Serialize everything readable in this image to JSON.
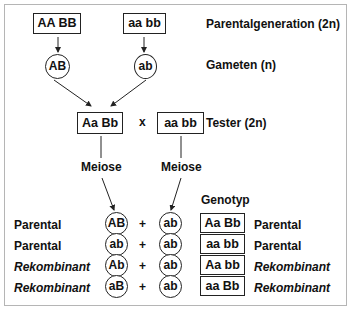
{
  "parental": {
    "left_genotype": "AA BB",
    "right_genotype": "aa bb",
    "label": "Parentalgeneration (2n)"
  },
  "gametes": {
    "left": "AB",
    "right": "ab",
    "label": "Gameten (n)"
  },
  "cross": {
    "f1_genotype": "Aa Bb",
    "operator": "x",
    "tester_genotype": "aa bb",
    "tester_label": "Tester (2n)"
  },
  "meiosis": {
    "left_label": "Meiose",
    "right_label": "Meiose"
  },
  "offspring": {
    "genotype_header": "Genotyp",
    "rows": [
      {
        "type_left": "Parental",
        "gamete_f1": "AB",
        "plus": "+",
        "gamete_tester": "ab",
        "genotype": "Aa Bb",
        "type_right": "Parental",
        "italic": false
      },
      {
        "type_left": "Parental",
        "gamete_f1": "ab",
        "plus": "+",
        "gamete_tester": "ab",
        "genotype": "aa bb",
        "type_right": "Parental",
        "italic": false
      },
      {
        "type_left": "Rekombinant",
        "gamete_f1": "Ab",
        "plus": "+",
        "gamete_tester": "ab",
        "genotype": "Aa bb",
        "type_right": "Rekombinant",
        "italic": true
      },
      {
        "type_left": "Rekombinant",
        "gamete_f1": "aB",
        "plus": "+",
        "gamete_tester": "ab",
        "genotype": "aa Bb",
        "type_right": "Rekombinant",
        "italic": true
      }
    ]
  }
}
